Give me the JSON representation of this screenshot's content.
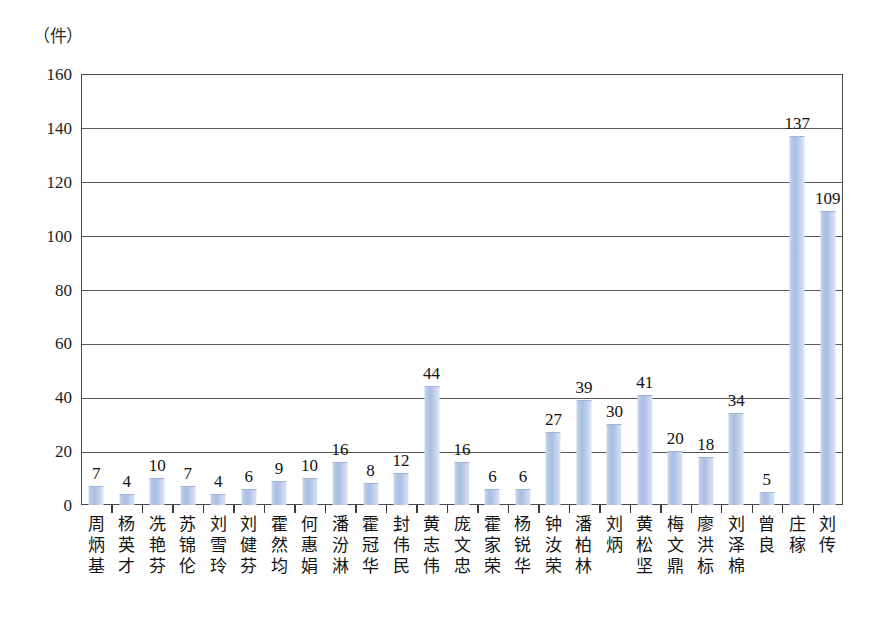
{
  "chart_data": {
    "type": "bar",
    "title": "",
    "subtitle": "",
    "unit_label": "（件）",
    "xlabel": "",
    "ylabel": "",
    "ylim": [
      0,
      160
    ],
    "ytick_step": 20,
    "yticks": [
      "0",
      "20",
      "40",
      "60",
      "80",
      "100",
      "120",
      "140",
      "160"
    ],
    "grid": true,
    "legend": "none",
    "bar_color": "#b6c6e6",
    "frame_color": "#4a4a4a",
    "categories": [
      "周炳基",
      "杨英才",
      "冼艳芬",
      "苏锦伦",
      "刘雪玲",
      "刘健芬",
      "霍然均",
      "何惠娟",
      "潘汾淋",
      "霍冠华",
      "封伟民",
      "黄志伟",
      "庞文忠",
      "霍家荣",
      "杨锐华",
      "钟汝荣",
      "潘柏林",
      "刘炳",
      "黄松坚",
      "梅文鼎",
      "廖洪标",
      "刘泽棉",
      "曾良",
      "庄稼",
      "刘传"
    ],
    "values": [
      7,
      4,
      10,
      7,
      4,
      6,
      9,
      10,
      16,
      8,
      12,
      44,
      16,
      6,
      6,
      27,
      39,
      30,
      41,
      20,
      18,
      34,
      5,
      137,
      109
    ],
    "value_labels": [
      "7",
      "4",
      "10",
      "7",
      "4",
      "6",
      "9",
      "10",
      "16",
      "8",
      "12",
      "44",
      "16",
      "6",
      "6",
      "27",
      "39",
      "30",
      "41",
      "20",
      "18",
      "34",
      "5",
      "137",
      "109"
    ]
  }
}
